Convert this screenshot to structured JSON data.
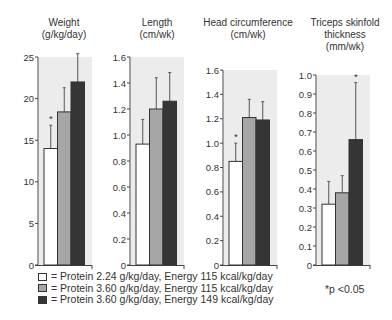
{
  "chart_data": [
    {
      "type": "bar",
      "title": "Weight (g/kg/day)",
      "title_lines": [
        "Weight",
        "(g/kg/day)"
      ],
      "ylim": [
        0,
        25
      ],
      "yticks": [
        0,
        5,
        10,
        15,
        20,
        25
      ],
      "ytick_labels": [
        "0",
        "5",
        "10",
        "15",
        "20",
        "25"
      ],
      "series": [
        {
          "name": "Protein 2.24 g/kg/day, Energy 115 kcal/kg/day",
          "value": 14.0,
          "error_top": 16.8,
          "significant": true
        },
        {
          "name": "Protein 3.60 g/kg/day, Energy 115 kcal/kg/day",
          "value": 18.4,
          "error_top": 21.3,
          "significant": false
        },
        {
          "name": "Protein 3.60 g/kg/day, Energy 149 kcal/kg/day",
          "value": 22.0,
          "error_top": 25.4,
          "significant": false
        }
      ]
    },
    {
      "type": "bar",
      "title": "Length (cm/wk)",
      "title_lines": [
        "Length",
        "(cm/wk)"
      ],
      "ylim": [
        0,
        1.6
      ],
      "yticks": [
        0,
        0.2,
        0.4,
        0.6,
        0.8,
        1.0,
        1.2,
        1.4,
        1.6
      ],
      "ytick_labels": [
        "0",
        "0.2",
        "0.4",
        "0.6",
        "0.8",
        "1.0",
        "1.2",
        "1.4",
        "1.6"
      ],
      "series": [
        {
          "name": "Protein 2.24 g/kg/day, Energy 115 kcal/kg/day",
          "value": 0.93,
          "error_top": 1.12,
          "significant": false
        },
        {
          "name": "Protein 3.60 g/kg/day, Energy 115 kcal/kg/day",
          "value": 1.2,
          "error_top": 1.44,
          "significant": false
        },
        {
          "name": "Protein 3.60 g/kg/day, Energy 149 kcal/kg/day",
          "value": 1.26,
          "error_top": 1.48,
          "significant": false
        }
      ]
    },
    {
      "type": "bar",
      "title": "Head circumference (cm/wk)",
      "title_lines": [
        "Head circumference",
        "(cm/wk)"
      ],
      "ylim": [
        0,
        1.6
      ],
      "yticks": [
        0,
        0.2,
        0.4,
        0.6,
        0.8,
        1.0,
        1.2,
        1.4,
        1.6
      ],
      "ytick_labels": [
        "0",
        "0.2",
        "0.4",
        "0.6",
        "0.8",
        "1.0",
        "1.2",
        "1.4",
        "1.6"
      ],
      "series": [
        {
          "name": "Protein 2.24 g/kg/day, Energy 115 kcal/kg/day",
          "value": 0.85,
          "error_top": 1.0,
          "significant": true
        },
        {
          "name": "Protein 3.60 g/kg/day, Energy 115 kcal/kg/day",
          "value": 1.21,
          "error_top": 1.36,
          "significant": false
        },
        {
          "name": "Protein 3.60 g/kg/day, Energy 149 kcal/kg/day",
          "value": 1.19,
          "error_top": 1.34,
          "significant": false
        }
      ]
    },
    {
      "type": "bar",
      "title": "Triceps skinfold thickness (mm/wk)",
      "title_lines": [
        "Triceps skinfold",
        "thickness",
        "(mm/wk)"
      ],
      "ylim": [
        0,
        1.0
      ],
      "yticks": [
        0,
        0.1,
        0.2,
        0.3,
        0.4,
        0.5,
        0.6,
        0.7,
        0.8,
        0.9,
        1.0
      ],
      "ytick_labels": [
        "0",
        "0.1",
        "0.2",
        "0.3",
        "0.4",
        "0.5",
        "0.6",
        "0.7",
        "0.8",
        "0.9",
        "1.0"
      ],
      "series": [
        {
          "name": "Protein 2.24 g/kg/day, Energy 115 kcal/kg/day",
          "value": 0.32,
          "error_top": 0.44,
          "significant": false
        },
        {
          "name": "Protein 3.60 g/kg/day, Energy 115 kcal/kg/day",
          "value": 0.38,
          "error_top": 0.47,
          "significant": false
        },
        {
          "name": "Protein 3.60 g/kg/day, Energy 149 kcal/kg/day",
          "value": 0.66,
          "error_top": 0.96,
          "significant": true
        }
      ]
    }
  ],
  "colors": {
    "group1": "#ffffff",
    "group2": "#a6a6a6",
    "group3": "#353535",
    "background_shade": "#ececec",
    "axis": "#444444"
  },
  "legend": {
    "items": [
      {
        "swatch": "#ffffff",
        "label": "= Protein 2.24 g/kg/day, Energy 115 kcal/kg/day"
      },
      {
        "swatch": "#a6a6a6",
        "label": "= Protein 3.60 g/kg/day, Energy 115 kcal/kg/day"
      },
      {
        "swatch": "#353535",
        "label": "= Protein 3.60 g/kg/day, Energy 149 kcal/kg/day"
      }
    ]
  },
  "note": "*p <0.05",
  "significance_marker": "*"
}
